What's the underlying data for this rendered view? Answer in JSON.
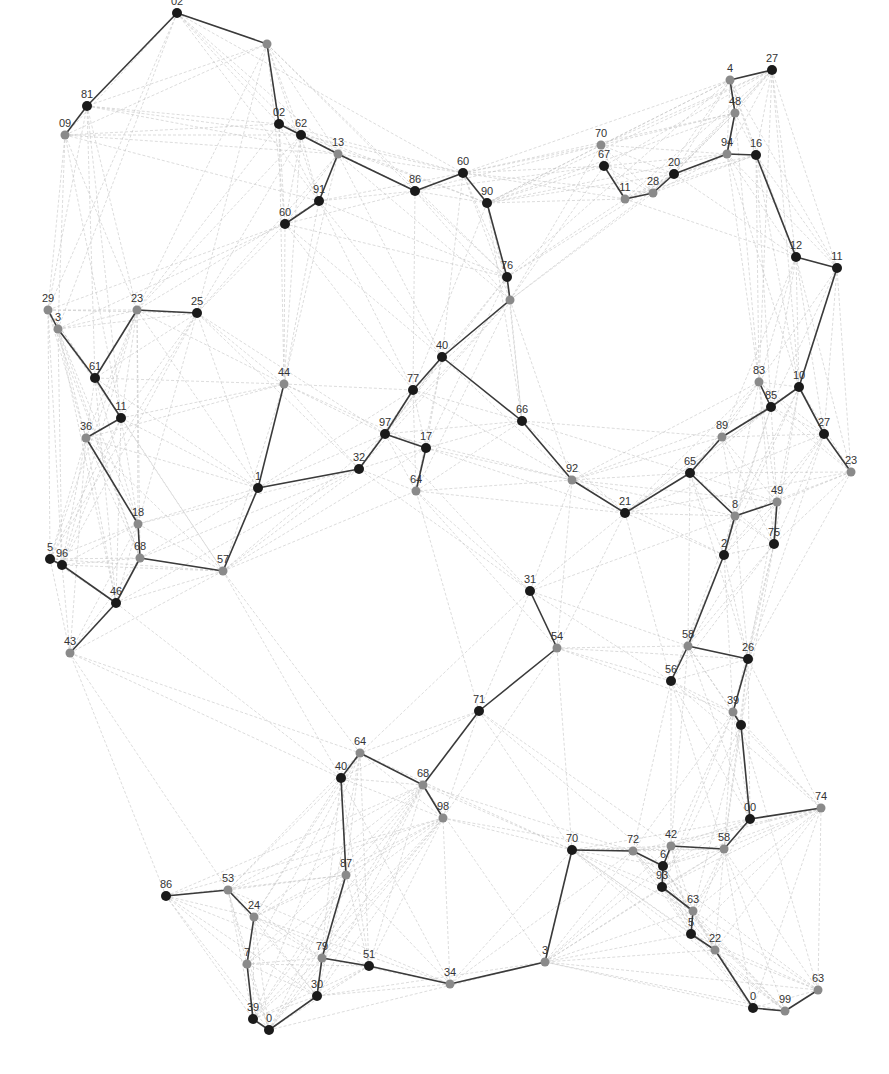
{
  "figure": {
    "type": "network-graph",
    "background": "#ffffff",
    "colors": {
      "node_dark": "#1a1a1a",
      "node_gray": "#8a8a8a",
      "edge_dark": "#3a3a3a",
      "edge_light": "#c4c4c4",
      "label": "#333333"
    }
  },
  "nodes": [
    {
      "id": "n1",
      "label": "02",
      "x": 177,
      "y": 13,
      "tone": "dark"
    },
    {
      "id": "n2",
      "label": "",
      "x": 267,
      "y": 44,
      "tone": "gray"
    },
    {
      "id": "n3",
      "label": "81",
      "x": 87,
      "y": 106,
      "tone": "dark"
    },
    {
      "id": "n4",
      "label": "09",
      "x": 65,
      "y": 135,
      "tone": "gray"
    },
    {
      "id": "n5",
      "label": "02",
      "x": 279,
      "y": 124,
      "tone": "dark"
    },
    {
      "id": "n6",
      "label": "62",
      "x": 301,
      "y": 135,
      "tone": "dark"
    },
    {
      "id": "n7",
      "label": "13",
      "x": 338,
      "y": 154,
      "tone": "gray"
    },
    {
      "id": "n8",
      "label": "91",
      "x": 319,
      "y": 201,
      "tone": "dark"
    },
    {
      "id": "n9",
      "label": "60",
      "x": 285,
      "y": 224,
      "tone": "dark"
    },
    {
      "id": "n10",
      "label": "86",
      "x": 415,
      "y": 191,
      "tone": "dark"
    },
    {
      "id": "n11",
      "label": "60",
      "x": 463,
      "y": 173,
      "tone": "dark"
    },
    {
      "id": "n12",
      "label": "90",
      "x": 487,
      "y": 203,
      "tone": "dark"
    },
    {
      "id": "n13",
      "label": "76",
      "x": 507,
      "y": 277,
      "tone": "dark"
    },
    {
      "id": "n14",
      "label": "",
      "x": 510,
      "y": 300,
      "tone": "gray"
    },
    {
      "id": "n15",
      "label": "70",
      "x": 601,
      "y": 145,
      "tone": "gray"
    },
    {
      "id": "n16",
      "label": "67",
      "x": 604,
      "y": 166,
      "tone": "dark"
    },
    {
      "id": "n17",
      "label": "11",
      "x": 625,
      "y": 199,
      "tone": "gray"
    },
    {
      "id": "n18",
      "label": "28",
      "x": 653,
      "y": 193,
      "tone": "gray"
    },
    {
      "id": "n19",
      "label": "20",
      "x": 674,
      "y": 174,
      "tone": "dark"
    },
    {
      "id": "n20",
      "label": "4",
      "x": 730,
      "y": 80,
      "tone": "gray"
    },
    {
      "id": "n21",
      "label": "27",
      "x": 772,
      "y": 70,
      "tone": "dark"
    },
    {
      "id": "n22",
      "label": "48",
      "x": 735,
      "y": 113,
      "tone": "gray"
    },
    {
      "id": "n23",
      "label": "94",
      "x": 727,
      "y": 154,
      "tone": "gray"
    },
    {
      "id": "n24",
      "label": "16",
      "x": 756,
      "y": 155,
      "tone": "dark"
    },
    {
      "id": "n25",
      "label": "12",
      "x": 796,
      "y": 257,
      "tone": "dark"
    },
    {
      "id": "n26",
      "label": "11",
      "x": 837,
      "y": 268,
      "tone": "dark"
    },
    {
      "id": "n27",
      "label": "29",
      "x": 48,
      "y": 310,
      "tone": "gray"
    },
    {
      "id": "n28",
      "label": "3",
      "x": 58,
      "y": 329,
      "tone": "gray"
    },
    {
      "id": "n29",
      "label": "23",
      "x": 137,
      "y": 310,
      "tone": "gray"
    },
    {
      "id": "n30",
      "label": "25",
      "x": 197,
      "y": 313,
      "tone": "dark"
    },
    {
      "id": "n31",
      "label": "61",
      "x": 95,
      "y": 378,
      "tone": "dark"
    },
    {
      "id": "n32",
      "label": "11",
      "x": 121,
      "y": 418,
      "tone": "dark"
    },
    {
      "id": "n33",
      "label": "36",
      "x": 86,
      "y": 438,
      "tone": "gray"
    },
    {
      "id": "n34",
      "label": "44",
      "x": 284,
      "y": 384,
      "tone": "gray"
    },
    {
      "id": "n35",
      "label": "40",
      "x": 442,
      "y": 357,
      "tone": "dark"
    },
    {
      "id": "n36",
      "label": "77",
      "x": 413,
      "y": 390,
      "tone": "dark"
    },
    {
      "id": "n37",
      "label": "97",
      "x": 385,
      "y": 434,
      "tone": "dark"
    },
    {
      "id": "n38",
      "label": "17",
      "x": 426,
      "y": 448,
      "tone": "dark"
    },
    {
      "id": "n39",
      "label": "32",
      "x": 359,
      "y": 469,
      "tone": "dark"
    },
    {
      "id": "n40",
      "label": "64",
      "x": 416,
      "y": 491,
      "tone": "gray"
    },
    {
      "id": "n41",
      "label": "1",
      "x": 258,
      "y": 488,
      "tone": "dark"
    },
    {
      "id": "n42",
      "label": "66",
      "x": 522,
      "y": 421,
      "tone": "dark"
    },
    {
      "id": "n43",
      "label": "92",
      "x": 572,
      "y": 480,
      "tone": "gray"
    },
    {
      "id": "n44",
      "label": "21",
      "x": 625,
      "y": 513,
      "tone": "dark"
    },
    {
      "id": "n45",
      "label": "65",
      "x": 690,
      "y": 473,
      "tone": "dark"
    },
    {
      "id": "n46",
      "label": "89",
      "x": 722,
      "y": 437,
      "tone": "gray"
    },
    {
      "id": "n47",
      "label": "83",
      "x": 759,
      "y": 382,
      "tone": "gray"
    },
    {
      "id": "n48",
      "label": "85",
      "x": 771,
      "y": 407,
      "tone": "dark"
    },
    {
      "id": "n49",
      "label": "10",
      "x": 799,
      "y": 387,
      "tone": "dark"
    },
    {
      "id": "n50",
      "label": "27",
      "x": 824,
      "y": 434,
      "tone": "dark"
    },
    {
      "id": "n51",
      "label": "23",
      "x": 851,
      "y": 472,
      "tone": "gray"
    },
    {
      "id": "n52",
      "label": "8",
      "x": 735,
      "y": 516,
      "tone": "gray"
    },
    {
      "id": "n53",
      "label": "49",
      "x": 777,
      "y": 502,
      "tone": "gray"
    },
    {
      "id": "n54",
      "label": "75",
      "x": 774,
      "y": 544,
      "tone": "dark"
    },
    {
      "id": "n55",
      "label": "2",
      "x": 724,
      "y": 555,
      "tone": "dark"
    },
    {
      "id": "n56",
      "label": "18",
      "x": 138,
      "y": 524,
      "tone": "gray"
    },
    {
      "id": "n57",
      "label": "5",
      "x": 50,
      "y": 559,
      "tone": "dark"
    },
    {
      "id": "n58",
      "label": "96",
      "x": 62,
      "y": 565,
      "tone": "dark"
    },
    {
      "id": "n59",
      "label": "68",
      "x": 140,
      "y": 558,
      "tone": "gray"
    },
    {
      "id": "n60",
      "label": "57",
      "x": 223,
      "y": 571,
      "tone": "gray"
    },
    {
      "id": "n61",
      "label": "46",
      "x": 116,
      "y": 603,
      "tone": "dark"
    },
    {
      "id": "n62",
      "label": "43",
      "x": 70,
      "y": 653,
      "tone": "gray"
    },
    {
      "id": "n63",
      "label": "31",
      "x": 530,
      "y": 591,
      "tone": "dark"
    },
    {
      "id": "n64",
      "label": "54",
      "x": 557,
      "y": 648,
      "tone": "gray"
    },
    {
      "id": "n65",
      "label": "58",
      "x": 688,
      "y": 646,
      "tone": "gray"
    },
    {
      "id": "n66",
      "label": "26",
      "x": 748,
      "y": 659,
      "tone": "dark"
    },
    {
      "id": "n67",
      "label": "56",
      "x": 671,
      "y": 681,
      "tone": "dark"
    },
    {
      "id": "n68",
      "label": "39",
      "x": 733,
      "y": 712,
      "tone": "gray"
    },
    {
      "id": "n69",
      "label": "",
      "x": 741,
      "y": 725,
      "tone": "dark"
    },
    {
      "id": "n70",
      "label": "71",
      "x": 479,
      "y": 711,
      "tone": "dark"
    },
    {
      "id": "n71",
      "label": "64",
      "x": 360,
      "y": 753,
      "tone": "gray"
    },
    {
      "id": "n72",
      "label": "40",
      "x": 341,
      "y": 778,
      "tone": "dark"
    },
    {
      "id": "n73",
      "label": "68",
      "x": 423,
      "y": 785,
      "tone": "gray"
    },
    {
      "id": "n74",
      "label": "98",
      "x": 443,
      "y": 818,
      "tone": "gray"
    },
    {
      "id": "n75",
      "label": "00",
      "x": 750,
      "y": 819,
      "tone": "dark"
    },
    {
      "id": "n76",
      "label": "74",
      "x": 821,
      "y": 808,
      "tone": "gray"
    },
    {
      "id": "n77",
      "label": "70",
      "x": 572,
      "y": 850,
      "tone": "dark"
    },
    {
      "id": "n78",
      "label": "72",
      "x": 633,
      "y": 851,
      "tone": "gray"
    },
    {
      "id": "n79",
      "label": "42",
      "x": 671,
      "y": 846,
      "tone": "gray"
    },
    {
      "id": "n80",
      "label": "58",
      "x": 724,
      "y": 849,
      "tone": "gray"
    },
    {
      "id": "n81",
      "label": "6",
      "x": 663,
      "y": 866,
      "tone": "dark"
    },
    {
      "id": "n82",
      "label": "93",
      "x": 662,
      "y": 887,
      "tone": "dark"
    },
    {
      "id": "n83",
      "label": "63",
      "x": 693,
      "y": 911,
      "tone": "gray"
    },
    {
      "id": "n84",
      "label": "5",
      "x": 691,
      "y": 934,
      "tone": "dark"
    },
    {
      "id": "n85",
      "label": "22",
      "x": 715,
      "y": 950,
      "tone": "gray"
    },
    {
      "id": "n86",
      "label": "86",
      "x": 166,
      "y": 896,
      "tone": "dark"
    },
    {
      "id": "n87",
      "label": "53",
      "x": 228,
      "y": 890,
      "tone": "gray"
    },
    {
      "id": "n88",
      "label": "24",
      "x": 254,
      "y": 917,
      "tone": "gray"
    },
    {
      "id": "n89",
      "label": "87",
      "x": 346,
      "y": 875,
      "tone": "gray"
    },
    {
      "id": "n90",
      "label": "7",
      "x": 247,
      "y": 964,
      "tone": "gray"
    },
    {
      "id": "n91",
      "label": "79",
      "x": 322,
      "y": 958,
      "tone": "gray"
    },
    {
      "id": "n92",
      "label": "51",
      "x": 369,
      "y": 966,
      "tone": "dark"
    },
    {
      "id": "n93",
      "label": "34",
      "x": 450,
      "y": 984,
      "tone": "gray"
    },
    {
      "id": "n94",
      "label": "3",
      "x": 545,
      "y": 962,
      "tone": "gray"
    },
    {
      "id": "n95",
      "label": "30",
      "x": 317,
      "y": 996,
      "tone": "dark"
    },
    {
      "id": "n96",
      "label": "39",
      "x": 253,
      "y": 1019,
      "tone": "dark"
    },
    {
      "id": "n97",
      "label": "0",
      "x": 269,
      "y": 1030,
      "tone": "dark"
    },
    {
      "id": "n98",
      "label": "0",
      "x": 753,
      "y": 1008,
      "tone": "dark"
    },
    {
      "id": "n99",
      "label": "99",
      "x": 785,
      "y": 1011,
      "tone": "gray"
    },
    {
      "id": "n100",
      "label": "63",
      "x": 818,
      "y": 990,
      "tone": "gray"
    }
  ],
  "dark_edges": [
    [
      "n4",
      "n3"
    ],
    [
      "n3",
      "n1"
    ],
    [
      "n1",
      "n2"
    ],
    [
      "n2",
      "n5"
    ],
    [
      "n5",
      "n6"
    ],
    [
      "n6",
      "n7"
    ],
    [
      "n7",
      "n10"
    ],
    [
      "n7",
      "n8"
    ],
    [
      "n8",
      "n9"
    ],
    [
      "n10",
      "n11"
    ],
    [
      "n11",
      "n12"
    ],
    [
      "n12",
      "n13"
    ],
    [
      "n13",
      "n14"
    ],
    [
      "n14",
      "n35"
    ],
    [
      "n35",
      "n36"
    ],
    [
      "n36",
      "n37"
    ],
    [
      "n37",
      "n38"
    ],
    [
      "n37",
      "n39"
    ],
    [
      "n39",
      "n41"
    ],
    [
      "n41",
      "n34"
    ],
    [
      "n41",
      "n60"
    ],
    [
      "n38",
      "n40"
    ],
    [
      "n35",
      "n42"
    ],
    [
      "n42",
      "n43"
    ],
    [
      "n43",
      "n44"
    ],
    [
      "n44",
      "n45"
    ],
    [
      "n45",
      "n46"
    ],
    [
      "n46",
      "n48"
    ],
    [
      "n48",
      "n47"
    ],
    [
      "n48",
      "n49"
    ],
    [
      "n49",
      "n26"
    ],
    [
      "n26",
      "n25"
    ],
    [
      "n25",
      "n24"
    ],
    [
      "n24",
      "n23"
    ],
    [
      "n23",
      "n22"
    ],
    [
      "n22",
      "n20"
    ],
    [
      "n20",
      "n21"
    ],
    [
      "n23",
      "n19"
    ],
    [
      "n19",
      "n18"
    ],
    [
      "n18",
      "n17"
    ],
    [
      "n17",
      "n16"
    ],
    [
      "n49",
      "n50"
    ],
    [
      "n50",
      "n51"
    ],
    [
      "n45",
      "n52"
    ],
    [
      "n52",
      "n53"
    ],
    [
      "n53",
      "n54"
    ],
    [
      "n52",
      "n55"
    ],
    [
      "n55",
      "n65"
    ],
    [
      "n65",
      "n67"
    ],
    [
      "n65",
      "n66"
    ],
    [
      "n66",
      "n68"
    ],
    [
      "n68",
      "n69"
    ],
    [
      "n69",
      "n75"
    ],
    [
      "n75",
      "n76"
    ],
    [
      "n75",
      "n80"
    ],
    [
      "n27",
      "n28"
    ],
    [
      "n28",
      "n31"
    ],
    [
      "n31",
      "n29"
    ],
    [
      "n29",
      "n30"
    ],
    [
      "n31",
      "n32"
    ],
    [
      "n32",
      "n33"
    ],
    [
      "n33",
      "n56"
    ],
    [
      "n56",
      "n59"
    ],
    [
      "n59",
      "n60"
    ],
    [
      "n59",
      "n61"
    ],
    [
      "n61",
      "n58"
    ],
    [
      "n58",
      "n57"
    ],
    [
      "n61",
      "n62"
    ],
    [
      "n63",
      "n64"
    ],
    [
      "n64",
      "n70"
    ],
    [
      "n70",
      "n73"
    ],
    [
      "n73",
      "n71"
    ],
    [
      "n71",
      "n72"
    ],
    [
      "n73",
      "n74"
    ],
    [
      "n72",
      "n89"
    ],
    [
      "n89",
      "n91"
    ],
    [
      "n91",
      "n95"
    ],
    [
      "n95",
      "n97"
    ],
    [
      "n97",
      "n96"
    ],
    [
      "n96",
      "n90"
    ],
    [
      "n90",
      "n88"
    ],
    [
      "n88",
      "n87"
    ],
    [
      "n87",
      "n86"
    ],
    [
      "n91",
      "n92"
    ],
    [
      "n92",
      "n93"
    ],
    [
      "n93",
      "n94"
    ],
    [
      "n94",
      "n77"
    ],
    [
      "n77",
      "n78"
    ],
    [
      "n78",
      "n81"
    ],
    [
      "n81",
      "n79"
    ],
    [
      "n79",
      "n80"
    ],
    [
      "n81",
      "n82"
    ],
    [
      "n82",
      "n83"
    ],
    [
      "n83",
      "n84"
    ],
    [
      "n84",
      "n85"
    ],
    [
      "n85",
      "n98"
    ],
    [
      "n98",
      "n99"
    ],
    [
      "n99",
      "n100"
    ]
  ],
  "light_edge_fan": 7,
  "caption": {
    "text": "",
    "note": "faint unreadable caption line along bottom edge"
  }
}
